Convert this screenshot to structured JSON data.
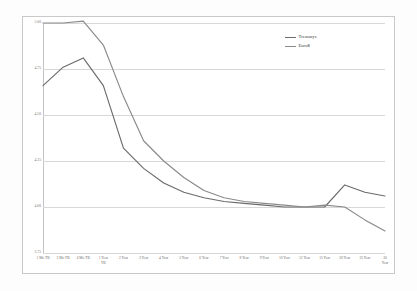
{
  "chart_data": {
    "type": "line",
    "title": "",
    "xlabel": "",
    "ylabel": "",
    "ylim": [
      3.75,
      5.0
    ],
    "yticks": [
      "5.00",
      "4.75",
      "4.50",
      "4.25",
      "4.00",
      "3.75"
    ],
    "ytick_values": [
      5.0,
      4.75,
      4.5,
      4.25,
      4.0,
      3.75
    ],
    "grid": true,
    "legend_position": "top-right",
    "categories": [
      "1 Mo TB",
      "3 Mo TB",
      "6 Mo TB",
      "1 Year\nTB",
      "2 Year",
      "3 Year",
      "4 Year",
      "5 Year",
      "6 Year",
      "7 Year",
      "8 Year",
      "9 Year",
      "10 Year",
      "12 Year",
      "15 Year",
      "20 Year",
      "25 Year",
      "30 Year"
    ],
    "series": [
      {
        "name": "Treasurys",
        "color": "#6b6b6b",
        "values": [
          4.66,
          4.76,
          4.81,
          4.66,
          4.32,
          4.21,
          4.13,
          4.08,
          4.05,
          4.03,
          4.02,
          4.01,
          4.0,
          4.0,
          4.0,
          4.12,
          4.08,
          4.06
        ]
      },
      {
        "name": "Euro$",
        "color": "#8a8a8a",
        "values": [
          5.0,
          5.0,
          5.01,
          4.88,
          4.6,
          4.36,
          4.25,
          4.16,
          4.09,
          4.05,
          4.03,
          4.02,
          4.01,
          4.0,
          4.01,
          4.0,
          3.93,
          3.87
        ]
      }
    ]
  },
  "legend": {
    "entries": [
      {
        "label": "Treasurys",
        "color": "#6b6b6b"
      },
      {
        "label": "Euro$",
        "color": "#8a8a8a"
      }
    ]
  }
}
